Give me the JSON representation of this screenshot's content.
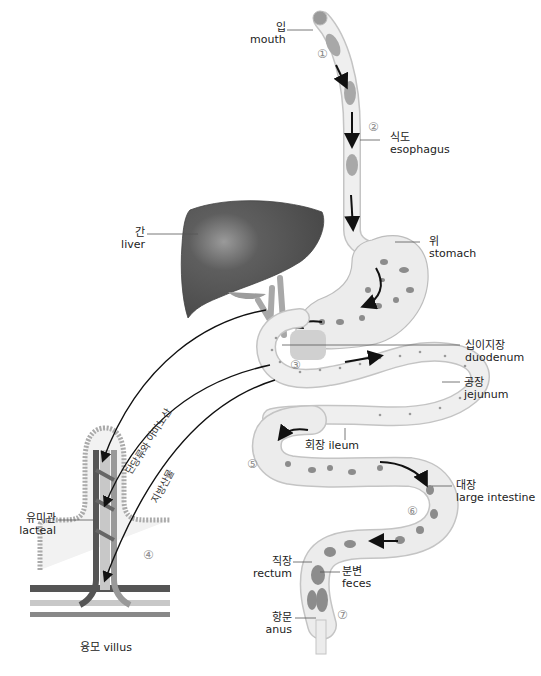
{
  "diagram": {
    "labels": {
      "mouth": {
        "ko": "입",
        "en": "mouth"
      },
      "esophagus": {
        "ko": "식도",
        "en": "esophagus"
      },
      "liver": {
        "ko": "간",
        "en": "liver"
      },
      "stomach": {
        "ko": "위",
        "en": "stomach"
      },
      "duodenum": {
        "ko": "십이지장",
        "en": "duodenum"
      },
      "jejunum": {
        "ko": "공장",
        "en": "jejunum"
      },
      "ileum": {
        "ko": "회장",
        "en": "ileum"
      },
      "large_intestine": {
        "ko": "대장",
        "en": "large intestine"
      },
      "rectum": {
        "ko": "직장",
        "en": "rectum"
      },
      "feces": {
        "ko": "분변",
        "en": "feces"
      },
      "anus": {
        "ko": "항문",
        "en": "anus"
      },
      "lacteal": {
        "ko": "유미관",
        "en": "lacteal"
      },
      "villus": {
        "ko": "융모",
        "en": "villus"
      }
    },
    "arrow_labels": {
      "monosaccharides_amino_acids": "단당류와 아미노산",
      "fat_products": "지방산물"
    },
    "step_numbers": [
      "①",
      "②",
      "③",
      "④",
      "⑤",
      "⑥",
      "⑦"
    ],
    "colors": {
      "organ_fill": "#ececec",
      "organ_stroke": "#bdbdbd",
      "particle": "#8c8c8c",
      "liver": "#5a5a5a",
      "arrow": "#111111",
      "vessel_dark": "#555555",
      "vessel_light": "#bdbdbd"
    }
  }
}
